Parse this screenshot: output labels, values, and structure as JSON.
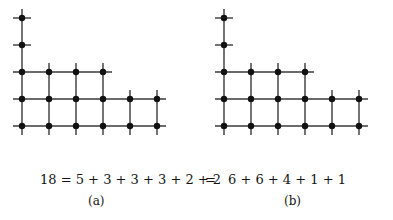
{
  "figure": {
    "caption": {
      "equation_left": "18 = 5 + 3 + 3 + 3 + 2 + 2",
      "equation_operator": "=",
      "equation_right": "6 + 6 + 4 + 1 + 1",
      "label_a": "(a)",
      "label_b": "(b)"
    },
    "style": {
      "line_color": "#3a3a3a",
      "dot_color": "#111111",
      "background": "#ffffff",
      "line_width": 1.4,
      "dot_radius": 3.2,
      "cell_size": 27,
      "overhang": 9
    },
    "panels": [
      {
        "id": "a",
        "name": "ferrers-diagram-a",
        "total": 18,
        "partition": [
          5,
          3,
          3,
          3,
          2,
          2
        ],
        "description": "Ferrers/Young dot diagram with grid lines, columns of heights 5,3,3,3,2,2 drawn bottom-aligned",
        "column_heights": [
          5,
          3,
          3,
          3,
          2,
          2
        ],
        "row_counts_bottom_up": [
          6,
          6,
          4,
          1,
          1
        ],
        "columns": 6,
        "rows": 5
      },
      {
        "id": "b",
        "name": "ferrers-diagram-b",
        "total": 18,
        "partition": [
          6,
          6,
          4,
          1,
          1
        ],
        "description": "Conjugate Ferrers/Young dot diagram, rows of lengths 6,6,4,1,1 from bottom up",
        "row_counts_bottom_up": [
          6,
          6,
          4,
          1,
          1
        ],
        "column_heights": [
          5,
          3,
          3,
          3,
          2,
          2
        ],
        "columns": 6,
        "rows": 5
      }
    ]
  }
}
